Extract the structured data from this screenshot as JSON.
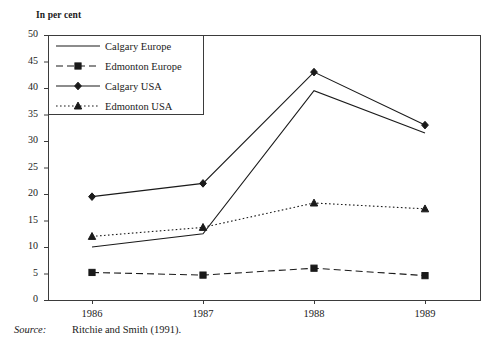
{
  "figure": {
    "unit_label": "In per cent",
    "source_label": "Source:",
    "source_value": "Ritchie and Smith (1991)."
  },
  "chart_data": {
    "type": "line",
    "title": "",
    "subtitle": "",
    "xlabel": "",
    "ylabel": "In per cent",
    "categories": [
      "1986",
      "1987",
      "1988",
      "1989"
    ],
    "x": [
      1986,
      1987,
      1988,
      1989
    ],
    "ylim": [
      0,
      50
    ],
    "yticks": [
      0,
      5,
      10,
      15,
      20,
      25,
      30,
      35,
      40,
      45,
      50
    ],
    "ytick_labels": [
      "0",
      "5",
      "10",
      "15",
      "20",
      "25",
      "30",
      "35",
      "40",
      "45",
      "50"
    ],
    "xtick_labels": [
      "1986",
      "1987",
      "1988",
      "1989"
    ],
    "grid": false,
    "legend_position": "top-left-inside",
    "series": [
      {
        "name": "Calgary Europe",
        "values": [
          10.0,
          12.5,
          39.5,
          31.5
        ],
        "line_style": "solid",
        "marker": "none",
        "color": "#1a1a1a"
      },
      {
        "name": "Edmonton Europe",
        "values": [
          5.2,
          4.7,
          6.0,
          4.6
        ],
        "line_style": "dashed",
        "marker": "square",
        "color": "#1a1a1a"
      },
      {
        "name": "Calgary USA",
        "values": [
          19.5,
          22.0,
          43.0,
          33.0
        ],
        "line_style": "solid",
        "marker": "diamond",
        "color": "#1a1a1a"
      },
      {
        "name": "Edmonton USA",
        "values": [
          12.0,
          13.7,
          18.3,
          17.2
        ],
        "line_style": "dotted",
        "marker": "triangle",
        "color": "#1a1a1a"
      }
    ]
  }
}
